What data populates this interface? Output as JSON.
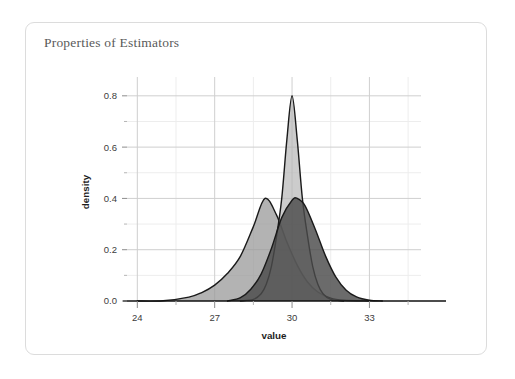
{
  "card": {
    "title": "Properties of Estimators",
    "border_color": "#dcdcdc",
    "background": "#ffffff"
  },
  "chart_data": {
    "type": "area",
    "title": "Properties of Estimators",
    "xlabel": "value",
    "ylabel": "density",
    "xlim": [
      23.6,
      35.0
    ],
    "ylim": [
      0.0,
      0.85
    ],
    "x_ticks_major": [
      24,
      27,
      30,
      33
    ],
    "x_ticks_minor": [
      25.5,
      28.5,
      31.5,
      34.5
    ],
    "y_ticks_major": [
      "0.0",
      "0.2",
      "0.4",
      "0.6",
      "0.8"
    ],
    "y_ticks_major_values": [
      0.0,
      0.2,
      0.4,
      0.6,
      0.8
    ],
    "y_ticks_minor_values": [
      0.1,
      0.3,
      0.5,
      0.7
    ],
    "grid": true,
    "grid_color_major": "#cfcfcf",
    "grid_color_minor": "#ededed",
    "legend": "none",
    "series": [
      {
        "name": "wide-left-density",
        "distribution": "normal",
        "mean": 28.95,
        "sd": 1.0,
        "peak_value": 0.4,
        "fill": "#9a9a9a",
        "fill_opacity": 0.75,
        "stroke": "#1a1a1a",
        "x": [
          24.0,
          25.0,
          26.0,
          26.5,
          27.0,
          27.5,
          28.0,
          28.5,
          28.95,
          29.4,
          29.8,
          30.2,
          30.6,
          31.0,
          31.5,
          32.0,
          33.0
        ],
        "y": [
          0.0,
          0.001,
          0.015,
          0.033,
          0.062,
          0.108,
          0.175,
          0.29,
          0.4,
          0.335,
          0.23,
          0.14,
          0.074,
          0.035,
          0.011,
          0.003,
          0.0
        ]
      },
      {
        "name": "tall-narrow-density",
        "distribution": "normal",
        "mean": 30.0,
        "sd": 0.5,
        "peak_value": 0.8,
        "fill": "#b4b4b4",
        "fill_opacity": 0.68,
        "stroke": "#1a1a1a",
        "x": [
          28.0,
          28.5,
          28.8,
          29.0,
          29.2,
          29.4,
          29.6,
          29.8,
          30.0,
          30.2,
          30.4,
          30.6,
          30.8,
          31.0,
          31.2,
          31.5,
          32.0
        ],
        "y": [
          0.0,
          0.006,
          0.028,
          0.065,
          0.135,
          0.253,
          0.4,
          0.63,
          0.8,
          0.63,
          0.4,
          0.253,
          0.135,
          0.065,
          0.028,
          0.006,
          0.0
        ]
      },
      {
        "name": "right-shifted-density",
        "distribution": "normal",
        "mean": 30.2,
        "sd": 0.95,
        "peak_value": 0.4,
        "fill": "#4a4a4a",
        "fill_opacity": 0.82,
        "stroke": "#1a1a1a",
        "x": [
          27.5,
          28.0,
          28.4,
          28.8,
          29.2,
          29.6,
          30.0,
          30.2,
          30.5,
          30.9,
          31.3,
          31.7,
          32.1,
          32.5,
          33.0,
          33.5
        ],
        "y": [
          0.0,
          0.013,
          0.046,
          0.105,
          0.205,
          0.325,
          0.393,
          0.4,
          0.372,
          0.28,
          0.175,
          0.093,
          0.042,
          0.016,
          0.003,
          0.0
        ]
      }
    ]
  }
}
